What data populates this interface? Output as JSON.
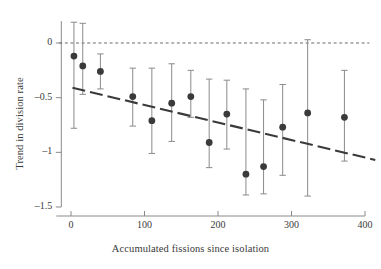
{
  "chart_data": {
    "type": "scatter",
    "title": "",
    "xlabel": "Accumulated fissions since isolation",
    "ylabel": "Trend in division rate",
    "xlim": [
      -20,
      410
    ],
    "ylim": [
      -1.62,
      0.22
    ],
    "xticks": [
      0,
      100,
      200,
      300,
      400
    ],
    "xtick_labels": [
      "0",
      "100",
      "200",
      "300",
      "400"
    ],
    "yticks": [
      0,
      -0.5,
      -1,
      -1.5
    ],
    "ytick_labels": [
      "0",
      "–0.5",
      "–1",
      "–1.5"
    ],
    "grid": false,
    "legend": false,
    "marker_color": "#3a3a3a",
    "errorbar_color": "#8a8a8a",
    "trendline_color": "#3a3a3a",
    "zeroline_color": "#6b6b6b",
    "axis_color": "#8a8a8a",
    "zero_reference_line": 0,
    "trend_line": {
      "style": "dashed",
      "x_start": 2,
      "y_start": -0.41,
      "x_end": 414,
      "y_end": -1.07
    },
    "points": [
      {
        "x": 4,
        "y": -0.12,
        "err_low": -0.78,
        "err_high": 0.19
      },
      {
        "x": 16,
        "y": -0.21,
        "err_low": -0.47,
        "err_high": 0.18
      },
      {
        "x": 40,
        "y": -0.26,
        "err_low": -0.42,
        "err_high": -0.1
      },
      {
        "x": 84,
        "y": -0.49,
        "err_low": -0.76,
        "err_high": -0.23
      },
      {
        "x": 110,
        "y": -0.71,
        "err_low": -1.01,
        "err_high": -0.23
      },
      {
        "x": 137,
        "y": -0.55,
        "err_low": -0.9,
        "err_high": -0.19
      },
      {
        "x": 163,
        "y": -0.49,
        "err_low": -0.68,
        "err_high": -0.25
      },
      {
        "x": 188,
        "y": -0.91,
        "err_low": -1.14,
        "err_high": -0.33
      },
      {
        "x": 212,
        "y": -0.65,
        "err_low": -0.97,
        "err_high": -0.34
      },
      {
        "x": 238,
        "y": -1.2,
        "err_low": -1.39,
        "err_high": -0.42
      },
      {
        "x": 262,
        "y": -1.13,
        "err_low": -1.38,
        "err_high": -0.52
      },
      {
        "x": 288,
        "y": -0.77,
        "err_low": -1.21,
        "err_high": -0.38
      },
      {
        "x": 322,
        "y": -0.64,
        "err_low": -1.4,
        "err_high": 0.03
      },
      {
        "x": 372,
        "y": -0.68,
        "err_low": -1.08,
        "err_high": -0.25
      }
    ]
  }
}
